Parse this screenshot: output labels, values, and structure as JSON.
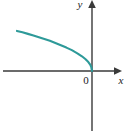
{
  "figure": {
    "title": "",
    "background_color": "#ffffff",
    "axis_color": "#3a3a3a",
    "curve_color": "#2e9a99",
    "label_color": "#1a1a1a"
  },
  "labels": {
    "x_axis": "x",
    "y_axis": "y",
    "origin": "0"
  },
  "chart_data": {
    "type": "line",
    "title": "",
    "xlabel": "x",
    "ylabel": "y",
    "grid": false,
    "legend": null,
    "axis_arrows": [
      "x-positive",
      "y-positive"
    ],
    "origin_label": "0",
    "xlim": [
      -4.5,
      2.0
    ],
    "ylim": [
      -3.2,
      3.4
    ],
    "tick_labels": {
      "x": [],
      "y": []
    },
    "series": [
      {
        "name": "curve",
        "color": "#2e9a99",
        "description": "decreasing concave-down curve in the second quadrant approaching the origin with steep negative slope",
        "x": [
          -4.1,
          -3.8,
          -3.5,
          -3.2,
          -2.9,
          -2.6,
          -2.3,
          -2.0,
          -1.7,
          -1.4,
          -1.1,
          -0.8,
          -0.55,
          -0.35,
          -0.2,
          -0.1,
          -0.04,
          0.0
        ],
        "y": [
          2.02,
          1.95,
          1.87,
          1.79,
          1.7,
          1.61,
          1.52,
          1.41,
          1.3,
          1.18,
          1.05,
          0.89,
          0.74,
          0.59,
          0.45,
          0.32,
          0.2,
          0.0
        ]
      }
    ]
  }
}
